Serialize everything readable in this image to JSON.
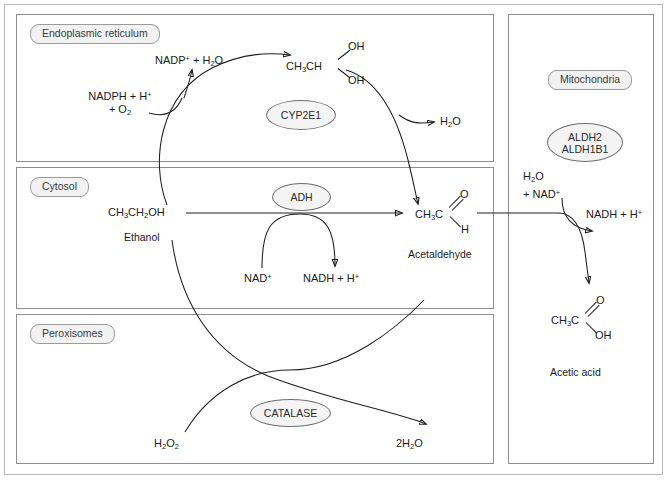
{
  "diagram": {
    "compartments": [
      {
        "id": "er",
        "label": "Endoplasmic reticulum"
      },
      {
        "id": "cytosol",
        "label": "Cytosol"
      },
      {
        "id": "peroxisomes",
        "label": "Peroxisomes"
      },
      {
        "id": "mitochondria",
        "label": "Mitochondria"
      }
    ],
    "enzymes": [
      {
        "id": "cyp2e1",
        "label": "CYP2E1",
        "compartment": "er"
      },
      {
        "id": "adh",
        "label": "ADH",
        "compartment": "cytosol"
      },
      {
        "id": "catalase",
        "label": "CATALASE",
        "compartment": "peroxisomes"
      },
      {
        "id": "aldh",
        "line1": "ALDH2",
        "line2": "ALDH1B1",
        "compartment": "mitochondria"
      }
    ],
    "er": {
      "cofactor_in_line1": "NADPH + H",
      "cofactor_in_line1_sup": "+",
      "cofactor_in_line2_pre": "+ O",
      "cofactor_in_line2_sub": "2",
      "cofactor_out_pre": "NADP",
      "cofactor_out_sup": "+",
      "cofactor_out_mid": " + H",
      "cofactor_out_sub": "2",
      "cofactor_out_post": "O",
      "diol_core": "CH",
      "diol_core_sub": "3",
      "diol_core_post": "CH",
      "diol_oh_top": "OH",
      "diol_oh_bottom": "OH",
      "water_out_pre": "H",
      "water_out_sub": "2",
      "water_out_post": "O"
    },
    "cytosol": {
      "substrate_pre": "CH",
      "substrate_sub1": "3",
      "substrate_mid": "CH",
      "substrate_sub2": "2",
      "substrate_post": "OH",
      "substrate_name": "Ethanol",
      "cofactor_in_pre": "NAD",
      "cofactor_in_sup": "+",
      "cofactor_out_pre": "NADH + H",
      "cofactor_out_sup": "+",
      "product_pre": "CH",
      "product_sub": "3",
      "product_post": "C",
      "product_o": "O",
      "product_h": "H",
      "product_name": "Acetaldehyde"
    },
    "peroxisomes": {
      "substrate_pre": "H",
      "substrate_sub1": "2",
      "substrate_mid": "O",
      "substrate_sub2": "2",
      "product_pre": "2H",
      "product_sub": "2",
      "product_post": "O"
    },
    "mitochondria": {
      "cofactor_in_line1_pre": "H",
      "cofactor_in_line1_sub": "2",
      "cofactor_in_line1_post": "O",
      "cofactor_in_line2_pre": "+ NAD",
      "cofactor_in_line2_sup": "+",
      "cofactor_out_pre": "NADH + H",
      "cofactor_out_sup": "+",
      "product_pre": "CH",
      "product_sub": "3",
      "product_post": "C",
      "product_o": "O",
      "product_oh": "OH",
      "product_name": "Acetic acid"
    },
    "colors": {
      "stroke": "#1f1f1f",
      "compartment_border": "#8e8e8e",
      "label_fill": "#f2f2f2",
      "frame": "#b9b9b9"
    }
  }
}
